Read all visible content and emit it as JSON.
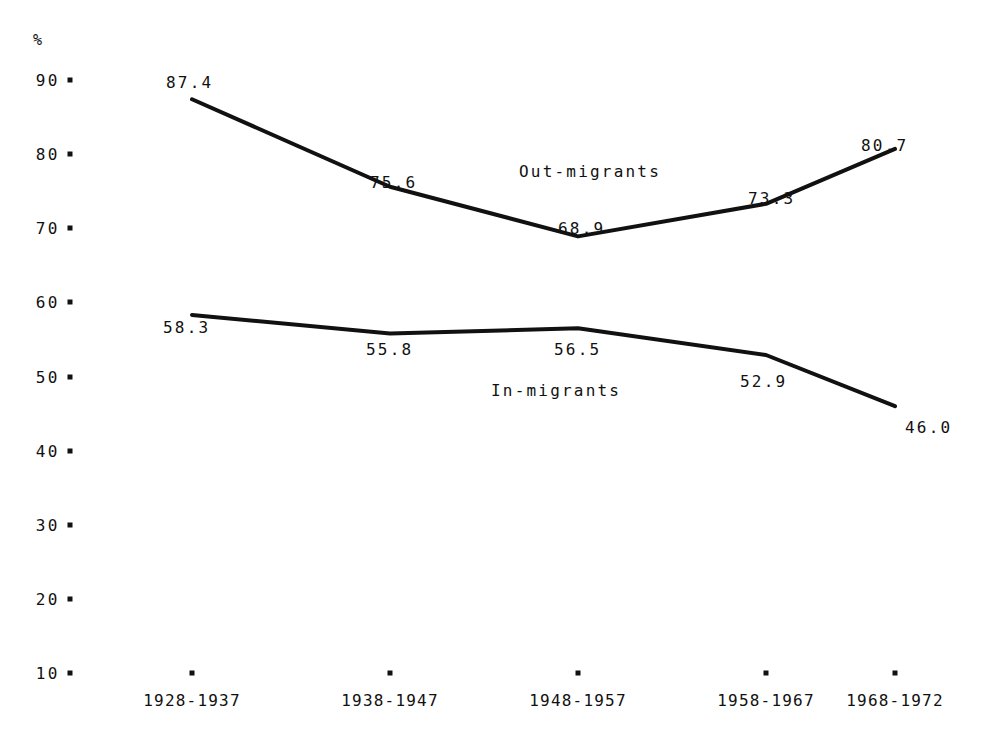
{
  "chart_data": {
    "type": "line",
    "title": "",
    "xlabel": "",
    "ylabel": "%",
    "categories": [
      "1928-1937",
      "1938-1947",
      "1948-1957",
      "1958-1967",
      "1968-1972"
    ],
    "ylim": [
      10,
      90
    ],
    "yticks": [
      "90",
      "80",
      "70",
      "60",
      "50",
      "40",
      "30",
      "20",
      "10"
    ],
    "ytick_values": [
      90,
      80,
      70,
      60,
      50,
      40,
      30,
      20,
      10
    ],
    "grid": false,
    "legend_position": "inline-annotation",
    "series": [
      {
        "name": "Out-migrants",
        "values": [
          87.4,
          75.6,
          68.9,
          73.3,
          80.7
        ],
        "labels": [
          "87.4",
          "75.6",
          "68.9",
          "73.3",
          "80.7"
        ]
      },
      {
        "name": "In-migrants",
        "values": [
          58.3,
          55.8,
          56.5,
          52.9,
          46.0
        ],
        "labels": [
          "58.3",
          "55.8",
          "56.5",
          "52.9",
          "46.0"
        ]
      }
    ],
    "annotations": [
      {
        "text": "Out-migrants",
        "x_px": 519,
        "y_px": 172
      },
      {
        "text": "In-migrants",
        "x_px": 491,
        "y_px": 391
      }
    ],
    "value_label_positions": [
      {
        "series": "Out-migrants",
        "label": "87.4",
        "x_px": 166,
        "y_px": 83
      },
      {
        "series": "Out-migrants",
        "label": "75.6",
        "x_px": 370,
        "y_px": 183
      },
      {
        "series": "Out-migrants",
        "label": "68.9",
        "x_px": 558,
        "y_px": 229
      },
      {
        "series": "Out-migrants",
        "label": "73.3",
        "x_px": 748,
        "y_px": 199
      },
      {
        "series": "Out-migrants",
        "label": "80.7",
        "x_px": 861,
        "y_px": 146
      },
      {
        "series": "In-migrants",
        "label": "58.3",
        "x_px": 163,
        "y_px": 328
      },
      {
        "series": "In-migrants",
        "label": "55.8",
        "x_px": 366,
        "y_px": 350
      },
      {
        "series": "In-migrants",
        "label": "56.5",
        "x_px": 554,
        "y_px": 350
      },
      {
        "series": "In-migrants",
        "label": "52.9",
        "x_px": 740,
        "y_px": 382
      },
      {
        "series": "In-migrants",
        "label": "46.0",
        "x_px": 905,
        "y_px": 428
      }
    ],
    "colors": {
      "line": "#111111",
      "text": "#111111",
      "background": "#ffffff"
    }
  }
}
